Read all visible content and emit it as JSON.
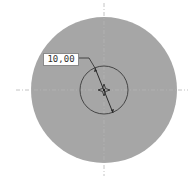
{
  "drawing": {
    "background_color": "#ffffff",
    "outer_disc": {
      "cx": 104,
      "cy": 90,
      "r": 73,
      "fill": "#a6a6a6"
    },
    "inner_circle": {
      "cx": 104,
      "cy": 90,
      "r": 24,
      "stroke": "#3a3a3a"
    },
    "center_lines": {
      "stroke": "#9a9a9a"
    },
    "dimension": {
      "label": "10,00",
      "type": "diameter"
    }
  }
}
